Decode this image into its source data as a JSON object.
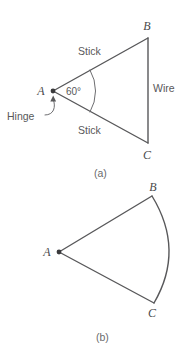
{
  "figure": {
    "title_text": "",
    "line_color": "#58585a",
    "label_color": "#58585a",
    "background": "#ffffff",
    "panels": [
      {
        "id": "panel-a",
        "caption": "(a)",
        "description": "Triangle formed by two sticks hinged at A and a wire from B to C",
        "vertices": [
          {
            "name": "A",
            "label": "A",
            "x": 53,
            "y": 91
          },
          {
            "name": "B",
            "label": "B",
            "x": 148,
            "y": 38
          },
          {
            "name": "C",
            "label": "C",
            "x": 148,
            "y": 143
          }
        ],
        "edge_labels": [
          {
            "name": "stick-top",
            "text": "Stick",
            "x": 78,
            "y": 55
          },
          {
            "name": "stick-bottom",
            "text": "Stick",
            "x": 78,
            "y": 134
          },
          {
            "name": "wire",
            "text": "Wire",
            "x": 153,
            "y": 92
          }
        ],
        "angle": {
          "value_text": "60°",
          "x": 66,
          "y": 95,
          "degrees": 60
        },
        "annotation": {
          "name": "hinge",
          "text": "Hinge",
          "x": 7,
          "y": 120,
          "arrow_from_x": 46,
          "arrow_from_y": 115,
          "arrow_to_x": 53,
          "arrow_to_y": 97
        },
        "caption_x": 94,
        "caption_y": 177
      },
      {
        "id": "panel-b",
        "caption": "(b)",
        "description": "Circular sector: two straight radii from A to B and A to C with a curved arc from B to C",
        "vertices": [
          {
            "name": "A",
            "label": "A",
            "x": 59,
            "y": 252
          },
          {
            "name": "B",
            "label": "B",
            "x": 152,
            "y": 196
          },
          {
            "name": "C",
            "label": "C",
            "x": 154,
            "y": 303
          }
        ],
        "arc": {
          "name": "arc-bc",
          "bulge_x": 174,
          "bulge_y": 250
        },
        "caption_x": 96,
        "caption_y": 341
      }
    ]
  }
}
